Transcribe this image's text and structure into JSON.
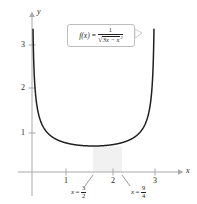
{
  "figure": {
    "axes": {
      "x_label": "x",
      "y_label": "y",
      "x_ticks": [
        "1",
        "2",
        "3"
      ],
      "y_ticks": [
        "1",
        "2",
        "3"
      ]
    },
    "callout": {
      "f_of_x": "f(x)",
      "equals": "=",
      "numerator": "1",
      "radical": "√",
      "radicand_a": "3x − x",
      "radicand_exp": "2"
    },
    "annotations": [
      {
        "name": "lower-limit",
        "var": "x",
        "eq": "=",
        "num": "3",
        "den": "2"
      },
      {
        "name": "upper-limit",
        "var": "x",
        "eq": "=",
        "num": "9",
        "den": "4"
      }
    ],
    "colors": {
      "curve": "#231f20",
      "axis": "#a7a9ac",
      "shade": "#f1f1f1",
      "callout_border": "#bcbec0"
    }
  },
  "chart_data": {
    "type": "line",
    "title": "",
    "xlabel": "x",
    "ylabel": "y",
    "xlim": [
      -0.35,
      3.35
    ],
    "ylim": [
      -0.35,
      3.9
    ],
    "grid": false,
    "legend": null,
    "function": "f(x) = 1 / sqrt(3x - x^2)",
    "xticks": [
      1,
      2,
      3
    ],
    "yticks": [
      1,
      2,
      3
    ],
    "vertical_asymptotes": [
      0,
      3
    ],
    "minimum": {
      "x": 1.5,
      "y": 0.667
    },
    "shaded_region": {
      "x_from": 1.5,
      "x_to": 2.25,
      "label_from": "3/2",
      "label_to": "9/4"
    },
    "series": [
      {
        "name": "f(x) = 1/sqrt(3x - x^2)",
        "x": [
          0.07,
          0.1,
          0.15,
          0.2,
          0.3,
          0.4,
          0.5,
          0.7,
          0.9,
          1.1,
          1.3,
          1.5,
          1.7,
          1.9,
          2.1,
          2.3,
          2.5,
          2.6,
          2.7,
          2.8,
          2.85,
          2.9,
          2.93
        ],
        "y": [
          2.2,
          1.84,
          1.51,
          1.32,
          1.09,
          0.96,
          0.89,
          0.8,
          0.75,
          0.71,
          0.68,
          0.667,
          0.68,
          0.71,
          0.75,
          0.8,
          0.89,
          0.96,
          1.09,
          1.32,
          1.51,
          1.84,
          2.2
        ]
      }
    ]
  }
}
